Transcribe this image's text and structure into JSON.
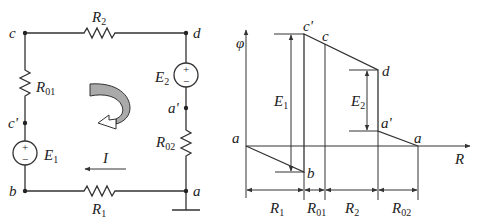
{
  "circuit": {
    "nodes": [
      {
        "id": "c",
        "label": "c"
      },
      {
        "id": "d",
        "label": "d"
      },
      {
        "id": "b",
        "label": "b"
      },
      {
        "id": "a",
        "label": "a"
      },
      {
        "id": "c_prime",
        "label": "c'"
      },
      {
        "id": "a_prime",
        "label": "a'"
      }
    ],
    "components": {
      "R2": {
        "main": "R",
        "sub": "2"
      },
      "R01": {
        "main": "R",
        "sub": "01"
      },
      "R02": {
        "main": "R",
        "sub": "02"
      },
      "R1": {
        "main": "R",
        "sub": "1"
      },
      "E1": {
        "main": "E",
        "sub": "1",
        "plus": "+",
        "minus": "−"
      },
      "E2": {
        "main": "E",
        "sub": "2",
        "plus": "+",
        "minus": "−"
      }
    },
    "current": {
      "label": "I"
    },
    "loop_direction_icon": "clockwise-curved-arrow"
  },
  "potential_diagram": {
    "y_axis_label": "φ",
    "x_axis_label": "R",
    "points": [
      {
        "label": "a",
        "position": "origin"
      },
      {
        "label": "b"
      },
      {
        "label": "c'"
      },
      {
        "label": "c"
      },
      {
        "label": "d"
      },
      {
        "label": "a'"
      },
      {
        "label": "a",
        "position": "end"
      }
    ],
    "emf_labels": {
      "E1": {
        "main": "E",
        "sub": "1"
      },
      "E2": {
        "main": "E",
        "sub": "2"
      }
    },
    "segments": [
      {
        "main": "R",
        "sub": "1"
      },
      {
        "main": "R",
        "sub": "01"
      },
      {
        "main": "R",
        "sub": "2"
      },
      {
        "main": "R",
        "sub": "02"
      }
    ]
  }
}
